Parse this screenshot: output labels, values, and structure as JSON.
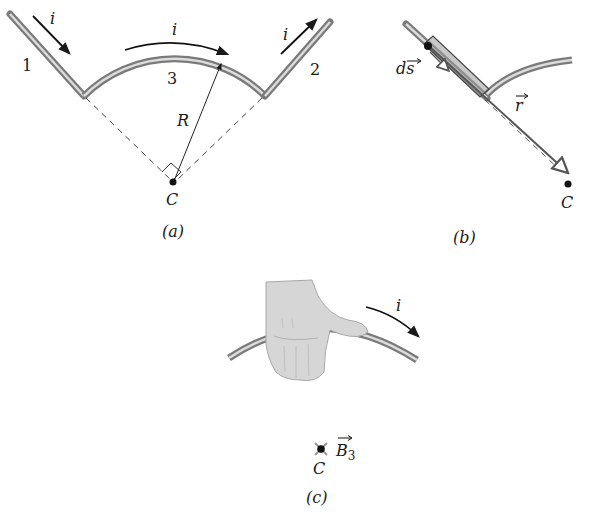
{
  "figure": {
    "panels": [
      {
        "id": "a",
        "caption": "(a)",
        "labels": {
          "current_1": "i",
          "current_3": "i",
          "current_2": "i",
          "segment_1": "1",
          "segment_2": "2",
          "segment_3": "3",
          "radius": "R",
          "center": "C"
        }
      },
      {
        "id": "b",
        "caption": "(b)",
        "labels": {
          "ds": "ds",
          "r": "r",
          "center": "C"
        }
      },
      {
        "id": "c",
        "caption": "(c)",
        "labels": {
          "current": "i",
          "field": "B",
          "field_sub": "3",
          "center": "C"
        }
      }
    ],
    "colors": {
      "wire_dark": "#6e6e6e",
      "wire_light": "#d9d9d9",
      "ink": "#1a1a1a",
      "hand": "#d6d6d6"
    }
  }
}
